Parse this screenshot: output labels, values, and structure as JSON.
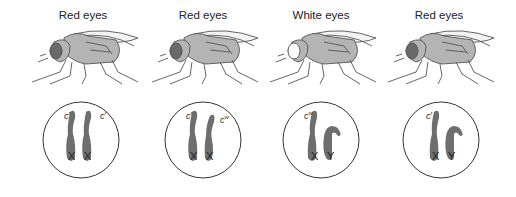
{
  "figure": {
    "panels": [
      {
        "phenotype": "Red eyes",
        "eye_color": "#6a6a6a",
        "sex": "female",
        "chromosomes": [
          {
            "type": "X",
            "allele_base": "c",
            "allele_sup": "r"
          },
          {
            "type": "X",
            "allele_base": "c",
            "allele_sup": "r"
          }
        ]
      },
      {
        "phenotype": "Red eyes",
        "eye_color": "#6a6a6a",
        "sex": "female",
        "chromosomes": [
          {
            "type": "X",
            "allele_base": "c",
            "allele_sup": "r"
          },
          {
            "type": "X",
            "allele_base": "c",
            "allele_sup": "w"
          }
        ]
      },
      {
        "phenotype": "White eyes",
        "eye_color": "#ffffff",
        "sex": "male",
        "chromosomes": [
          {
            "type": "X",
            "allele_base": "c",
            "allele_sup": "w"
          },
          {
            "type": "Y",
            "allele_base": "",
            "allele_sup": ""
          }
        ]
      },
      {
        "phenotype": "Red eyes",
        "eye_color": "#6a6a6a",
        "sex": "male",
        "chromosomes": [
          {
            "type": "X",
            "allele_base": "c",
            "allele_sup": "r"
          },
          {
            "type": "Y",
            "allele_base": "",
            "allele_sup": ""
          }
        ]
      }
    ]
  },
  "colors": {
    "body_fill": "#b4b4b4",
    "outline": "#555555",
    "chromosome_fill": "#6e6e6e",
    "circle_stroke": "#333333"
  }
}
